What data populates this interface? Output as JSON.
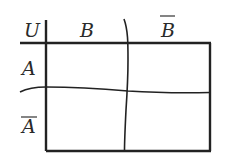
{
  "diagram": {
    "universe_label": "U",
    "columns": [
      {
        "label": "B",
        "complement": false
      },
      {
        "label": "B",
        "complement": true
      }
    ],
    "rows": [
      {
        "label": "A",
        "complement": false
      },
      {
        "label": "A",
        "complement": true
      }
    ],
    "line_color": "#222222",
    "background": "#ffffff"
  }
}
